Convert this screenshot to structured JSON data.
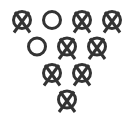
{
  "diagram": {
    "stroke_color": "#333333",
    "background": "#ffffff",
    "legend": {
      "knocked": "circle with X (pin knocked down)",
      "standing": "open circle (pin standing)"
    },
    "rows": [
      {
        "pins": [
          {
            "number": 7,
            "state": "knocked",
            "cx": 22,
            "cy": 20
          },
          {
            "number": 8,
            "state": "standing",
            "cx": 52,
            "cy": 20
          },
          {
            "number": 9,
            "state": "knocked",
            "cx": 82,
            "cy": 20
          },
          {
            "number": 10,
            "state": "knocked",
            "cx": 112,
            "cy": 20
          }
        ]
      },
      {
        "pins": [
          {
            "number": 4,
            "state": "standing",
            "cx": 37,
            "cy": 46.5
          },
          {
            "number": 5,
            "state": "knocked",
            "cx": 67,
            "cy": 46.5
          },
          {
            "number": 6,
            "state": "knocked",
            "cx": 97,
            "cy": 46.5
          }
        ]
      },
      {
        "pins": [
          {
            "number": 2,
            "state": "knocked",
            "cx": 52,
            "cy": 73
          },
          {
            "number": 3,
            "state": "knocked",
            "cx": 82,
            "cy": 73
          }
        ]
      },
      {
        "pins": [
          {
            "number": 1,
            "state": "knocked",
            "cx": 67,
            "cy": 99.5
          }
        ]
      }
    ]
  }
}
